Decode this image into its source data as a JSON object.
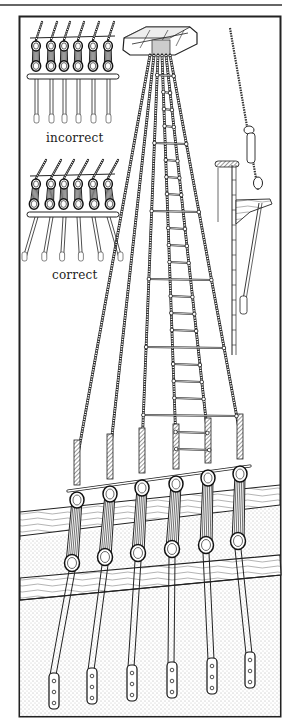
{
  "figure": {
    "labels": {
      "incorrect": "incorrect",
      "correct": "correct"
    },
    "insets": [
      {
        "id": "incorrect-inset",
        "label_key": "incorrect",
        "deadeye_pairs": 6
      },
      {
        "id": "correct-inset",
        "label_key": "correct",
        "deadeye_pairs": 6
      }
    ],
    "main": {
      "shrouds": 6,
      "deadeye_pairs": 6,
      "chain_plates": 6
    },
    "colors": {
      "ink": "#1a1a1a",
      "paper": "#ffffff",
      "frame": "#2a2a2a",
      "stipple": "#9a9a9a"
    }
  }
}
